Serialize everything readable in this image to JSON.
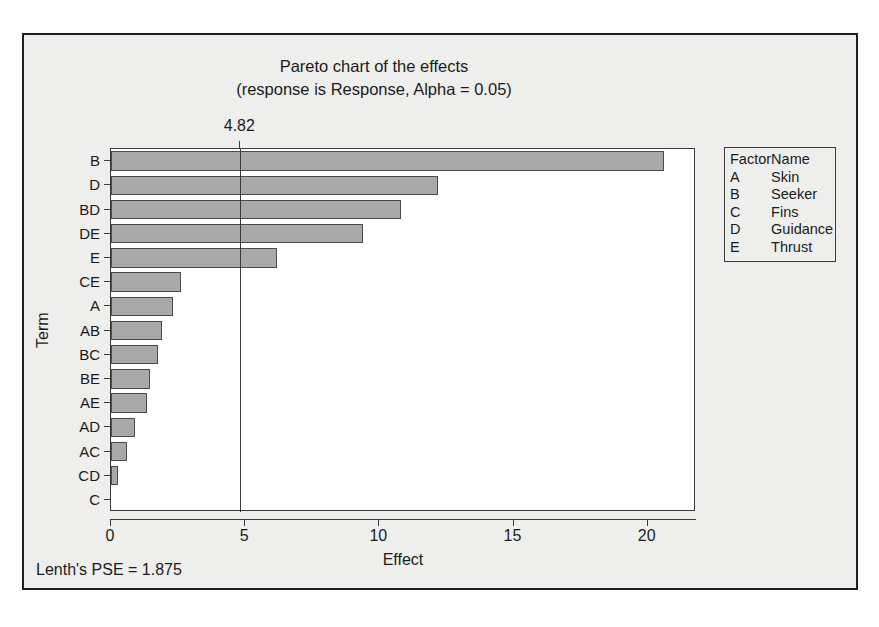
{
  "chart_data": {
    "type": "bar",
    "orientation": "horizontal",
    "title": "Pareto chart of the effects",
    "subtitle": "(response is Response, Alpha = 0.05)",
    "xlabel": "Effect",
    "ylabel": "Term",
    "xlim": [
      0,
      21.8
    ],
    "xticks": [
      0,
      5,
      10,
      15,
      20
    ],
    "xtick_labels": [
      "0",
      "5",
      "10",
      "15",
      "20"
    ],
    "grid": false,
    "categories": [
      "B",
      "D",
      "BD",
      "DE",
      "E",
      "CE",
      "A",
      "AB",
      "BC",
      "BE",
      "AE",
      "AD",
      "AC",
      "CD",
      "C"
    ],
    "values": [
      20.6,
      12.2,
      10.8,
      9.4,
      6.2,
      2.6,
      2.3,
      1.9,
      1.75,
      1.45,
      1.35,
      0.9,
      0.6,
      0.25,
      0.0
    ],
    "reference_line": {
      "value": 4.82,
      "label": "4.82"
    },
    "bar_color": "#a9a9a9",
    "bar_edge_color": "#4a4a4a",
    "annotations": [
      "Lenth's PSE = 1.875"
    ]
  },
  "legend": {
    "header": {
      "factor": "Factor",
      "name": "Name"
    },
    "rows": [
      {
        "factor": "A",
        "name": "Skin"
      },
      {
        "factor": "B",
        "name": "Seeker"
      },
      {
        "factor": "C",
        "name": "Fins"
      },
      {
        "factor": "D",
        "name": "Guidance"
      },
      {
        "factor": "E",
        "name": "Thrust"
      }
    ]
  },
  "footer": {
    "text": "Lenth's PSE = 1.875"
  }
}
